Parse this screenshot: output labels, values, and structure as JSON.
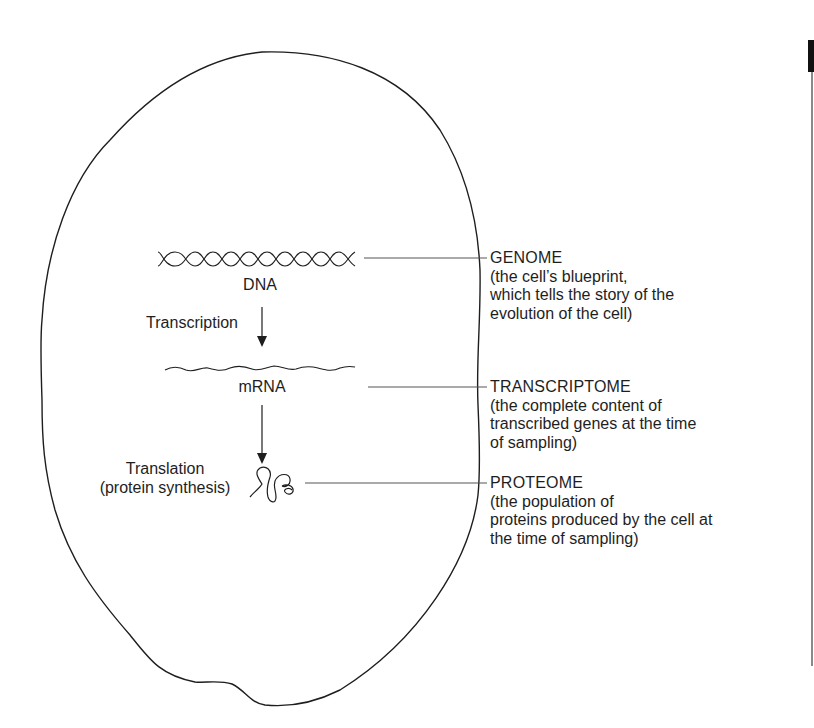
{
  "diagram": {
    "type": "cell-omics-flow",
    "stages": [
      {
        "id": "dna",
        "label": "DNA"
      },
      {
        "id": "mrna",
        "label": "mRNA"
      }
    ],
    "processes": {
      "transcription": "Transcription",
      "translation_line1": "Translation",
      "translation_line2": "(protein synthesis)"
    },
    "annotations": [
      {
        "title": "GENOME",
        "description": [
          "(the cell’s blueprint,",
          "which tells the story of the",
          "evolution of the cell)"
        ]
      },
      {
        "title": "TRANSCRIPTOME",
        "description": [
          "(the complete content of",
          "transcribed genes at the time",
          "of sampling)"
        ]
      },
      {
        "title": "PROTEOME",
        "description": [
          "(the population of",
          "proteins produced by the cell at",
          "the time of sampling)"
        ]
      }
    ],
    "icons": [
      "cell-outline",
      "dna-helix-icon",
      "mrna-strand-icon",
      "protein-fold-icon",
      "arrow-down-icon"
    ],
    "colors": {
      "stroke": "#1e1e1e",
      "leader": "#555555",
      "background": "#ffffff"
    }
  }
}
